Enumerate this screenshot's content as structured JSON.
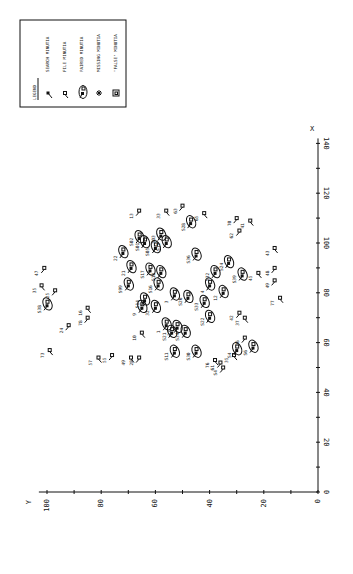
{
  "chart_data": {
    "type": "scatter",
    "title": "",
    "xlabel": "X",
    "ylabel": "Y",
    "orientation": "rotated-90",
    "xlim": [
      0,
      140
    ],
    "ylim": [
      0,
      100
    ],
    "x_ticks": [
      "0",
      "20",
      "40",
      "60",
      "80",
      "100",
      "120",
      "140"
    ],
    "y_ticks": [
      "0",
      "20",
      "40",
      "60",
      "80",
      "100"
    ],
    "grid": false,
    "legend": {
      "title": "LEGEND",
      "placement": "top-left",
      "entries": [
        {
          "kind": "search",
          "label": "SEARCH MINUTIA"
        },
        {
          "kind": "file",
          "label": "FILE MINUTIA"
        },
        {
          "kind": "paired",
          "label": "PAIRED MINUTIA"
        },
        {
          "kind": "missing",
          "label": "MISSING MINUTIA"
        },
        {
          "kind": "false",
          "label": "\"FALSE\" MINUTIA"
        }
      ]
    },
    "series": [
      {
        "name": "paired",
        "points": [
          {
            "x": 75,
            "y": 100,
            "label": "S38"
          },
          {
            "x": 96,
            "y": 72,
            "label": "22"
          },
          {
            "x": 90,
            "y": 69,
            "label": "21"
          },
          {
            "x": 83,
            "y": 70,
            "label": "S99"
          },
          {
            "x": 77,
            "y": 64,
            "label": "S14"
          },
          {
            "x": 74,
            "y": 65,
            "label": "9"
          },
          {
            "x": 102,
            "y": 66,
            "label": "S02"
          },
          {
            "x": 100,
            "y": 64,
            "label": "S01"
          },
          {
            "x": 103,
            "y": 58,
            "label": "S03"
          },
          {
            "x": 98,
            "y": 60,
            "label": "S05"
          },
          {
            "x": 100,
            "y": 56,
            "label": "S15"
          },
          {
            "x": 89,
            "y": 62,
            "label": "S17"
          },
          {
            "x": 88,
            "y": 58,
            "label": "S18"
          },
          {
            "x": 83,
            "y": 59,
            "label": "S16"
          },
          {
            "x": 74,
            "y": 60,
            "label": "32"
          },
          {
            "x": 108,
            "y": 47,
            "label": "S28"
          },
          {
            "x": 95,
            "y": 45,
            "label": "S36"
          },
          {
            "x": 79,
            "y": 53,
            "label": "3"
          },
          {
            "x": 78,
            "y": 48,
            "label": "S26"
          },
          {
            "x": 83,
            "y": 40,
            "label": "4"
          },
          {
            "x": 88,
            "y": 38,
            "label": "S32"
          },
          {
            "x": 92,
            "y": 33,
            "label": "S24"
          },
          {
            "x": 80,
            "y": 35,
            "label": "12"
          },
          {
            "x": 87,
            "y": 28,
            "label": "S39"
          },
          {
            "x": 67,
            "y": 56,
            "label": "1"
          },
          {
            "x": 64,
            "y": 54,
            "label": "S21"
          },
          {
            "x": 66,
            "y": 52,
            "label": "27"
          },
          {
            "x": 64,
            "y": 49,
            "label": "S34"
          },
          {
            "x": 56,
            "y": 53,
            "label": "S11"
          },
          {
            "x": 56,
            "y": 45,
            "label": "S30"
          },
          {
            "x": 70,
            "y": 40,
            "label": "S22"
          },
          {
            "x": 76,
            "y": 42,
            "label": "S33"
          },
          {
            "x": 57,
            "y": 30,
            "label": "S4"
          },
          {
            "x": 58,
            "y": 24,
            "label": "S6"
          }
        ]
      },
      {
        "name": "file",
        "points": [
          {
            "x": 90,
            "y": 101,
            "label": "47"
          },
          {
            "x": 83,
            "y": 102,
            "label": "35"
          },
          {
            "x": 81,
            "y": 97,
            "label": "25"
          },
          {
            "x": 57,
            "y": 99,
            "label": "73"
          },
          {
            "x": 67,
            "y": 92,
            "label": "24"
          },
          {
            "x": 74,
            "y": 85,
            "label": "16"
          },
          {
            "x": 70,
            "y": 85,
            "label": "78"
          },
          {
            "x": 54,
            "y": 81,
            "label": "57"
          },
          {
            "x": 55,
            "y": 76,
            "label": "55"
          },
          {
            "x": 54,
            "y": 69,
            "label": "49"
          },
          {
            "x": 54,
            "y": 66,
            "label": "28"
          },
          {
            "x": 64,
            "y": 65,
            "label": "10"
          },
          {
            "x": 113,
            "y": 66,
            "label": "13"
          },
          {
            "x": 113,
            "y": 56,
            "label": "33"
          },
          {
            "x": 115,
            "y": 50,
            "label": "63"
          },
          {
            "x": 112,
            "y": 42,
            "label": "65"
          },
          {
            "x": 110,
            "y": 30,
            "label": "70"
          },
          {
            "x": 109,
            "y": 25,
            "label": "41"
          },
          {
            "x": 105,
            "y": 29,
            "label": "62"
          },
          {
            "x": 98,
            "y": 16,
            "label": "43"
          },
          {
            "x": 90,
            "y": 16,
            "label": "48"
          },
          {
            "x": 88,
            "y": 22,
            "label": "45"
          },
          {
            "x": 85,
            "y": 16,
            "label": "49"
          },
          {
            "x": 78,
            "y": 14,
            "label": "77"
          },
          {
            "x": 72,
            "y": 29,
            "label": "42"
          },
          {
            "x": 70,
            "y": 27,
            "label": "37"
          },
          {
            "x": 62,
            "y": 27,
            "label": "36"
          },
          {
            "x": 55,
            "y": 31,
            "label": "35"
          },
          {
            "x": 52,
            "y": 36,
            "label": "61"
          },
          {
            "x": 53,
            "y": 38,
            "label": "76"
          },
          {
            "x": 50,
            "y": 35,
            "label": "S4"
          }
        ]
      }
    ]
  }
}
